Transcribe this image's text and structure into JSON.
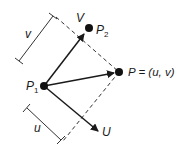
{
  "diagram": {
    "labels": {
      "p1": "P",
      "p1_sub": "1",
      "p2": "P",
      "p2_sub": "2",
      "v_vector": "V",
      "u_vector": "U",
      "p_point": "P = (u, v)",
      "v_measure": "v",
      "u_measure": "u"
    },
    "points": {
      "P1": [
        44,
        86
      ],
      "P2": [
        89,
        28
      ],
      "P": [
        119,
        72
      ]
    },
    "colors": {
      "line": "#1a1a1a",
      "background": "#ffffff"
    }
  }
}
